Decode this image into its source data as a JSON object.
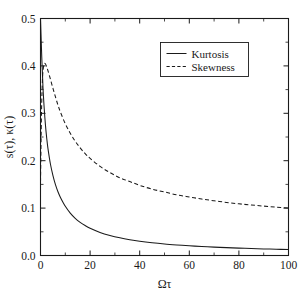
{
  "figure": {
    "width": 305,
    "height": 297,
    "background_color": "#ffffff",
    "foreground_color": "#1a1a1a"
  },
  "chart_data": {
    "type": "line",
    "title": "",
    "xlabel": "Ωτ",
    "ylabel": "s(τ), κ(τ)",
    "xlim": [
      0,
      100
    ],
    "ylim": [
      0.0,
      0.5
    ],
    "grid": false,
    "legend_position": "top-right",
    "xticks": [
      0,
      20,
      40,
      60,
      80,
      100
    ],
    "xtick_labels": [
      "0",
      "20",
      "40",
      "60",
      "80",
      "100"
    ],
    "xminor_step": 10,
    "yticks": [
      0.0,
      0.1,
      0.2,
      0.3,
      0.4,
      0.5
    ],
    "ytick_labels": [
      "0.0",
      "0.1",
      "0.2",
      "0.3",
      "0.4",
      "0.5"
    ],
    "yminor_step": 0.05,
    "series": [
      {
        "name": "Kurtosis",
        "style": "solid",
        "color": "#1a1a1a",
        "x": [
          0,
          0.5,
          1,
          1.5,
          2,
          2.5,
          3,
          4,
          5,
          6,
          7,
          8,
          9,
          10,
          12,
          14,
          16,
          18,
          20,
          24,
          28,
          32,
          36,
          40,
          45,
          50,
          55,
          60,
          65,
          70,
          75,
          80,
          85,
          90,
          95,
          100
        ],
        "y": [
          0.5,
          0.42,
          0.355,
          0.31,
          0.275,
          0.248,
          0.226,
          0.193,
          0.169,
          0.15,
          0.135,
          0.123,
          0.113,
          0.104,
          0.0895,
          0.0785,
          0.07,
          0.0632,
          0.0575,
          0.0487,
          0.0423,
          0.0373,
          0.0334,
          0.0302,
          0.027,
          0.0244,
          0.0223,
          0.0205,
          0.019,
          0.0177,
          0.0166,
          0.0156,
          0.0147,
          0.0139,
          0.0132,
          0.0126
        ]
      },
      {
        "name": "Skewness",
        "style": "dashed",
        "color": "#1a1a1a",
        "x": [
          0,
          0.4,
          0.8,
          1.2,
          1.6,
          2,
          2.5,
          3,
          4,
          5,
          6,
          7,
          8,
          10,
          12,
          14,
          16,
          18,
          20,
          24,
          28,
          32,
          36,
          40,
          45,
          50,
          55,
          60,
          65,
          70,
          75,
          80,
          85,
          90,
          95,
          100
        ],
        "y": [
          0.155,
          0.3,
          0.372,
          0.398,
          0.405,
          0.404,
          0.398,
          0.39,
          0.372,
          0.353,
          0.335,
          0.318,
          0.303,
          0.278,
          0.258,
          0.241,
          0.227,
          0.215,
          0.205,
          0.188,
          0.175,
          0.164,
          0.156,
          0.148,
          0.14,
          0.134,
          0.128,
          0.1235,
          0.119,
          0.1155,
          0.112,
          0.109,
          0.1065,
          0.1042,
          0.1021,
          0.1
        ]
      }
    ]
  },
  "legend": {
    "entries": [
      {
        "label": "Kurtosis",
        "style": "solid"
      },
      {
        "label": "Skewness",
        "style": "dashed"
      }
    ]
  }
}
